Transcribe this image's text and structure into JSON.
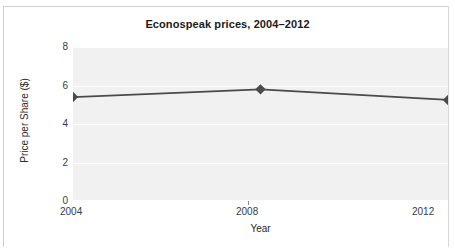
{
  "chart_data": {
    "type": "line",
    "title": "Econospeak prices, 2004–2012",
    "xlabel": "Year",
    "ylabel": "Price per Share ($)",
    "categories": [
      "2004",
      "2008",
      "2012"
    ],
    "x": [
      2004,
      2008,
      2012
    ],
    "values": [
      5.4,
      5.8,
      5.25
    ],
    "series": [
      {
        "name": "Econospeak price per share",
        "values": [
          5.4,
          5.8,
          5.25
        ]
      }
    ],
    "ylim": [
      0,
      8
    ],
    "yticks": [
      0,
      2,
      4,
      6,
      8
    ],
    "ytick_labels": [
      "0",
      "2",
      "4",
      "6",
      "8"
    ],
    "xtick_labels": [
      "2004",
      "2008",
      "2012"
    ],
    "grid": true,
    "grid_orientation": "horizontal",
    "legend": false,
    "legend_position": "none",
    "marker": "diamond",
    "plot_background": "#f1f1f1",
    "gridline_color": "#ffffff",
    "series_color": "#4a4a4a",
    "text_color": "#2a2a2a",
    "frame_color": "#cfcfcf"
  }
}
